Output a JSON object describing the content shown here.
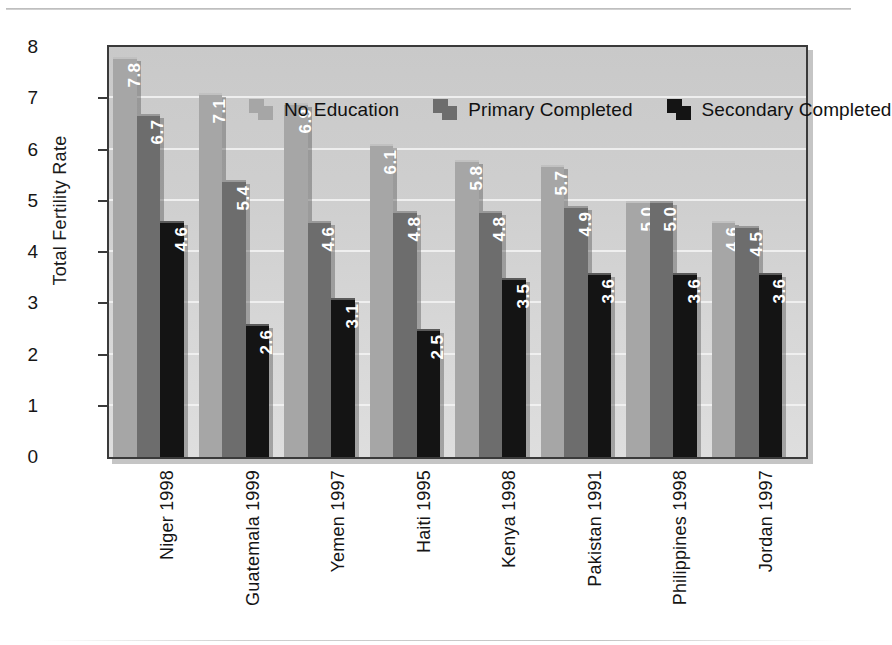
{
  "chart_data": {
    "type": "bar",
    "title": "",
    "xlabel": "",
    "ylabel": "Total Fertility Rate",
    "ylim": [
      0,
      8
    ],
    "yticks": [
      0,
      1,
      2,
      3,
      4,
      5,
      6,
      7,
      8
    ],
    "ytick_labels": [
      "0",
      "1",
      "2",
      "3",
      "4",
      "5",
      "6",
      "7",
      "8"
    ],
    "grid": true,
    "legend_position": "top-inside",
    "value_labels": true,
    "categories": [
      "Niger 1998",
      "Guatemala 1999",
      "Yemen 1997",
      "Haiti 1995",
      "Kenya 1998",
      "Pakistan 1991",
      "Philippines 1998",
      "Jordan 1997"
    ],
    "series": [
      {
        "name": "No Education",
        "color": "#a6a6a6",
        "values": [
          7.8,
          7.1,
          6.9,
          6.1,
          5.8,
          5.7,
          5.0,
          4.6
        ],
        "labels": [
          "7.8",
          "7.1",
          "6.9",
          "6.1",
          "5.8",
          "5.7",
          "5.0",
          "4.6"
        ]
      },
      {
        "name": "Primary Completed",
        "color": "#6d6d6d",
        "values": [
          6.7,
          5.4,
          4.6,
          4.8,
          4.8,
          4.9,
          5.0,
          4.5
        ],
        "labels": [
          "6.7",
          "5.4",
          "4.6",
          "4.8",
          "4.8",
          "4.9",
          "5.0",
          "4.5"
        ]
      },
      {
        "name": "Secondary Completed",
        "color": "#141414",
        "values": [
          4.6,
          2.6,
          3.1,
          2.5,
          3.5,
          3.6,
          3.6,
          3.6
        ],
        "labels": [
          "4.6",
          "2.6",
          "3.1",
          "2.5",
          "3.5",
          "3.6",
          "3.6",
          "3.6"
        ]
      }
    ]
  },
  "colors": {
    "plot_background": "#d2d2d2",
    "gridline": "#f2f2f2",
    "axis": "#3a3a3a",
    "value_label_text": "#ffffff",
    "page_background": "#ffffff"
  }
}
